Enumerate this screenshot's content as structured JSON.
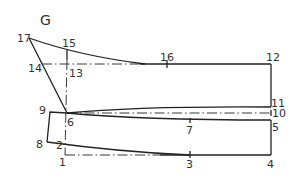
{
  "title": "G",
  "points": [
    {
      "id": "1",
      "x": 65,
      "y": 155
    },
    {
      "id": "2",
      "x": 63,
      "y": 145
    },
    {
      "id": "3",
      "x": 190,
      "y": 155
    },
    {
      "id": "4",
      "x": 271,
      "y": 155
    },
    {
      "id": "5",
      "x": 271,
      "y": 120
    },
    {
      "id": "6",
      "x": 67,
      "y": 113
    },
    {
      "id": "7",
      "x": 190,
      "y": 120
    },
    {
      "id": "8",
      "x": 47,
      "y": 142
    },
    {
      "id": "9",
      "x": 50,
      "y": 112
    },
    {
      "id": "10",
      "x": 271,
      "y": 113
    },
    {
      "id": "11",
      "x": 271,
      "y": 107
    },
    {
      "id": "12",
      "x": 271,
      "y": 64
    },
    {
      "id": "13",
      "x": 67,
      "y": 64
    },
    {
      "id": "14",
      "x": 42,
      "y": 64
    },
    {
      "id": "15",
      "x": 67,
      "y": 52
    },
    {
      "id": "16",
      "x": 167,
      "y": 64
    },
    {
      "id": "17",
      "x": 29,
      "y": 38
    }
  ],
  "labels": {
    "p1": "1",
    "p2": "2",
    "p3": "3",
    "p4": "4",
    "p5": "5",
    "p6": "6",
    "p7": "7",
    "p8": "8",
    "p9": "9",
    "p10": "10",
    "p11": "11",
    "p12": "12",
    "p13": "13",
    "p14": "14",
    "p15": "15",
    "p16": "16",
    "p17": "17"
  },
  "colors": {
    "line": "#222222",
    "text": "#333333",
    "background": "#ffffff"
  }
}
